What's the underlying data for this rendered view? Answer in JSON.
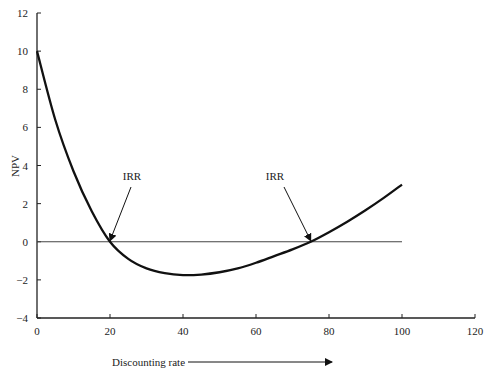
{
  "chart_data": {
    "type": "line",
    "title": "",
    "xlabel": "Discounting rate",
    "ylabel": "NPV",
    "xlim": [
      0,
      120
    ],
    "ylim": [
      -4,
      12
    ],
    "x_ticks": [
      0,
      20,
      40,
      60,
      80,
      100,
      120
    ],
    "y_ticks": [
      -4,
      -2,
      0,
      2,
      4,
      6,
      8,
      10,
      12
    ],
    "x_tick_labels": [
      "0",
      "20",
      "40",
      "60",
      "80",
      "100",
      "120"
    ],
    "y_tick_labels": [
      "−4",
      "−2",
      "0",
      "2",
      "4",
      "6",
      "8",
      "10",
      "12"
    ],
    "grid": false,
    "legend": null,
    "series": [
      {
        "name": "NPV",
        "x": [
          0,
          5,
          10,
          15,
          20,
          25,
          30,
          35,
          40,
          45,
          50,
          55,
          60,
          65,
          70,
          75,
          80,
          85,
          90,
          95,
          100
        ],
        "values": [
          10,
          6.4,
          3.7,
          1.6,
          0,
          -0.9,
          -1.4,
          -1.65,
          -1.75,
          -1.72,
          -1.6,
          -1.4,
          -1.1,
          -0.75,
          -0.4,
          0,
          0.5,
          1.05,
          1.65,
          2.3,
          3.0
        ]
      },
      {
        "name": "zero line",
        "x": [
          0,
          100
        ],
        "values": [
          0,
          0
        ]
      }
    ],
    "annotations": [
      {
        "text": "IRR",
        "points_to": [
          20,
          0
        ]
      },
      {
        "text": "IRR",
        "points_to": [
          75,
          0
        ]
      }
    ],
    "xlabel_arrow": true
  }
}
